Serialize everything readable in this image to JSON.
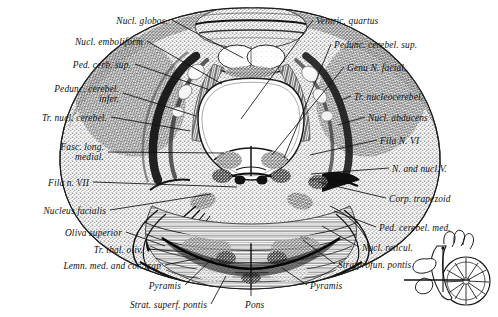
{
  "figure": {
    "type": "anatomical-cross-section",
    "specimen": "human brainstem / pons",
    "ink_color": "#1a1a1a",
    "background_color": "#ffffff"
  },
  "labels_left": [
    {
      "id": "nucl-globos",
      "text": "Nucl. globos.",
      "text2": "",
      "x": 168,
      "y": 16,
      "lx": 172,
      "ly": 20,
      "tx": 243,
      "ty": 58
    },
    {
      "id": "nucl-emboliform",
      "text": "Nucl. emboliform",
      "text2": "",
      "x": 143,
      "y": 37,
      "lx": 147,
      "ly": 41,
      "tx": 222,
      "ty": 84
    },
    {
      "id": "ped-cerb-sup",
      "text": "Ped. cerb. sup.",
      "text2": "",
      "x": 131,
      "y": 60,
      "lx": 135,
      "ly": 64,
      "tx": 210,
      "ty": 90
    },
    {
      "id": "pedunc-cerebel-inf",
      "text": "Pedunc. cerebel.",
      "text2": "infer.",
      "x": 119,
      "y": 84,
      "lx": 123,
      "ly": 93,
      "tx": 196,
      "ty": 116
    },
    {
      "id": "tr-nucl-cerebel",
      "text": "Tr. nucl. cerebel.",
      "text2": "",
      "x": 107,
      "y": 113,
      "lx": 111,
      "ly": 117,
      "tx": 190,
      "ty": 131
    },
    {
      "id": "fasc-long-medial",
      "text": "Fasc. long.",
      "text2": "medial.",
      "x": 104,
      "y": 142,
      "lx": 108,
      "ly": 152,
      "tx": 224,
      "ty": 153
    },
    {
      "id": "fila-n-vii",
      "text": "Fila n. VII",
      "text2": "",
      "x": 89,
      "y": 178,
      "lx": 93,
      "ly": 182,
      "tx": 237,
      "ty": 187
    },
    {
      "id": "nucleus-facialis",
      "text": "Nucleus facialis",
      "text2": "",
      "x": 106,
      "y": 206,
      "lx": 110,
      "ly": 210,
      "tx": 211,
      "ty": 194
    },
    {
      "id": "oliva-superior",
      "text": "Oliva superior",
      "text2": "",
      "x": 122,
      "y": 228,
      "lx": 126,
      "ly": 232,
      "tx": 165,
      "ty": 246
    },
    {
      "id": "tr-thal-oliv",
      "text": "Tr. thal. oliv.",
      "text2": "",
      "x": 143,
      "y": 245,
      "lx": 147,
      "ly": 249,
      "tx": 189,
      "ty": 252
    },
    {
      "id": "lemn-med-cor-trap",
      "text": "Lemn. med. and cor. trap",
      "text2": "",
      "x": 161,
      "y": 261,
      "lx": 165,
      "ly": 265,
      "tx": 200,
      "ty": 258
    },
    {
      "id": "pyramis-left",
      "text": "Pyramis",
      "text2": "",
      "x": 181,
      "y": 281,
      "lx": 185,
      "ly": 285,
      "tx": 213,
      "ty": 258
    },
    {
      "id": "strat-superf-pontis",
      "text": "Strat. superf. pontis",
      "text2": "",
      "x": 207,
      "y": 300,
      "lx": 211,
      "ly": 304,
      "tx": 226,
      "ty": 276
    }
  ],
  "labels_right": [
    {
      "id": "ventric-quartus",
      "text": "Ventric. quartus",
      "text2": "",
      "x": 316,
      "y": 16,
      "lx": 313,
      "ly": 20,
      "tx": 241,
      "ty": 119
    },
    {
      "id": "pedunc-cerebel-sup",
      "text": "Pedunc. cerebel. sup.",
      "text2": "",
      "x": 334,
      "y": 40,
      "lx": 331,
      "ly": 44,
      "tx": 284,
      "ty": 158
    },
    {
      "id": "genu-n-facial",
      "text": "Genu N. facial.",
      "text2": "",
      "x": 347,
      "y": 63,
      "lx": 344,
      "ly": 67,
      "tx": 272,
      "ty": 155
    },
    {
      "id": "tr-nucleocerebel",
      "text": "Tr. nucleocerebel.",
      "text2": "",
      "x": 354,
      "y": 92,
      "lx": 351,
      "ly": 96,
      "tx": 341,
      "ty": 100
    },
    {
      "id": "nucl-abducens",
      "text": "Nucl. abducens",
      "text2": "",
      "x": 368,
      "y": 113,
      "lx": 365,
      "ly": 117,
      "tx": 338,
      "ty": 125
    },
    {
      "id": "fila-n-vi",
      "text": "Fila N. VI",
      "text2": "",
      "x": 380,
      "y": 136,
      "lx": 377,
      "ly": 140,
      "tx": 310,
      "ty": 155
    },
    {
      "id": "n-and-nucl-v",
      "text": "N. and nucl.V.",
      "text2": "",
      "x": 392,
      "y": 164,
      "lx": 389,
      "ly": 168,
      "tx": 311,
      "ty": 174
    },
    {
      "id": "corp-trapezoid",
      "text": "Corp. trapezoid",
      "text2": "",
      "x": 389,
      "y": 194,
      "lx": 386,
      "ly": 198,
      "tx": 318,
      "ty": 182
    },
    {
      "id": "ped-cerebel-med",
      "text": "Ped. cerebel. med.",
      "text2": "",
      "x": 379,
      "y": 223,
      "lx": 376,
      "ly": 227,
      "tx": 334,
      "ty": 211
    },
    {
      "id": "nucl-reticul",
      "text": "Nucl. reticul.",
      "text2": "",
      "x": 362,
      "y": 243,
      "lx": 359,
      "ly": 247,
      "tx": 322,
      "ty": 226
    },
    {
      "id": "stratprofun-pontis",
      "text": "Stratprofun. pontis",
      "text2": "",
      "x": 338,
      "y": 260,
      "lx": 335,
      "ly": 264,
      "tx": 303,
      "ty": 240
    },
    {
      "id": "pyramis-right",
      "text": "Pyramis",
      "text2": "",
      "x": 310,
      "y": 281,
      "lx": 307,
      "ly": 285,
      "tx": 282,
      "ty": 268
    }
  ],
  "labels_center": [
    {
      "id": "pons",
      "text": "Pons",
      "x": 245,
      "y": 300,
      "lx": 251,
      "ly": 296,
      "tx": 251,
      "ty": 244
    }
  ],
  "inset": {
    "id": "orientation-inset",
    "description": "midsagittal brainstem and cerebellum with section-plane line",
    "x": 420,
    "y": 236,
    "w": 78,
    "h": 80
  }
}
